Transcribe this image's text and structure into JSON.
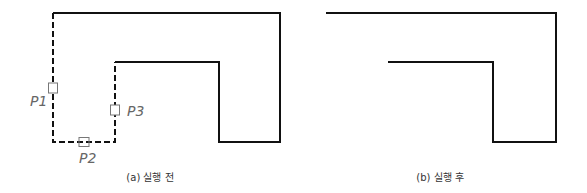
{
  "figure_a": {
    "caption": "(a) 실행 전",
    "points": [
      "P1",
      "P2",
      "P3"
    ],
    "labels": {
      "p1": "P1",
      "p2": "P2",
      "p3": "P3"
    }
  },
  "figure_b": {
    "caption": "(b) 실행 후"
  },
  "colors": {
    "line": "#111111",
    "label": "#666666",
    "marker": "#777777"
  }
}
